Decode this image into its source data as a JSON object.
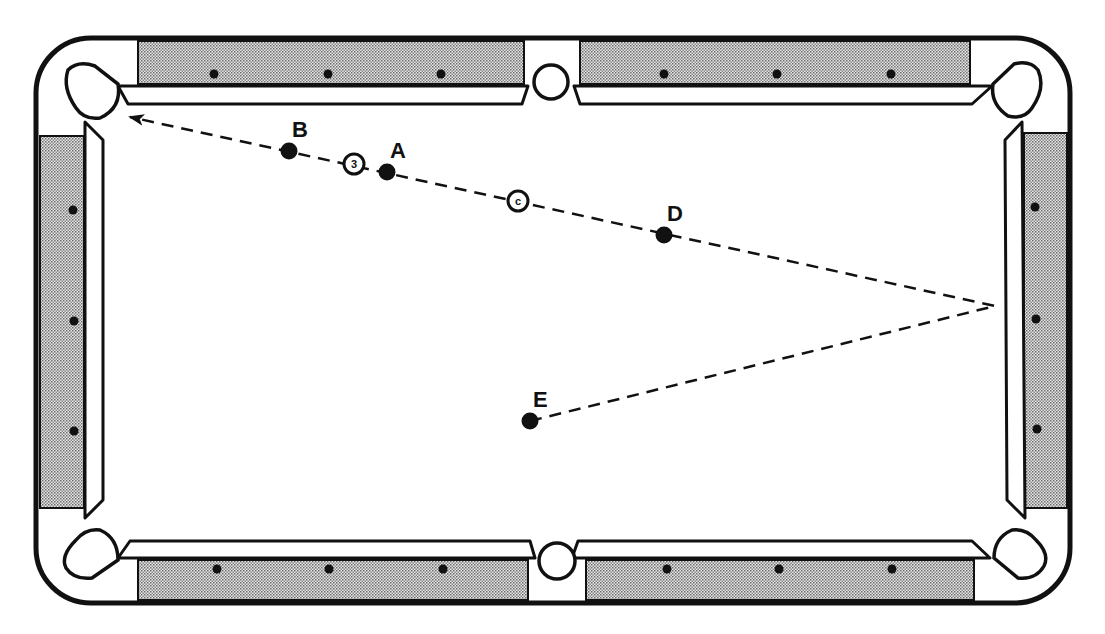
{
  "diagram": {
    "type": "pool-table-shot-diagram",
    "colors": {
      "line": "#111111",
      "rail_fill": "#bdbdbd",
      "background": "#ffffff"
    },
    "balls": [
      {
        "id": "A",
        "label": "A",
        "x": 387,
        "y": 172
      },
      {
        "id": "B",
        "label": "B",
        "x": 289,
        "y": 151
      },
      {
        "id": "D",
        "label": "D",
        "x": 664,
        "y": 235
      },
      {
        "id": "E",
        "label": "E",
        "x": 530,
        "y": 421
      }
    ],
    "marked_balls": [
      {
        "id": "ball-3",
        "label": "3",
        "x": 354,
        "y": 164
      },
      {
        "id": "cue-ball",
        "label": "c",
        "x": 518,
        "y": 201
      }
    ],
    "shot_path": {
      "style": "dashed",
      "points": [
        [
          530,
          421
        ],
        [
          995,
          306
        ],
        [
          130,
          117
        ]
      ],
      "arrow_at_end": true,
      "bank_point": [
        995,
        306
      ]
    },
    "diamonds": {
      "top": [
        [
          214,
          74
        ],
        [
          328,
          74
        ],
        [
          441,
          74
        ],
        [
          664,
          74
        ],
        [
          777,
          74
        ],
        [
          891,
          74
        ]
      ],
      "bottom": [
        [
          217,
          569
        ],
        [
          329,
          569
        ],
        [
          443,
          569
        ],
        [
          667,
          569
        ],
        [
          779,
          569
        ],
        [
          892,
          569
        ]
      ],
      "left": [
        [
          73,
          210
        ],
        [
          74,
          321
        ],
        [
          74,
          431
        ]
      ],
      "right": [
        [
          1035,
          207
        ],
        [
          1036,
          319
        ],
        [
          1037,
          429
        ]
      ]
    }
  }
}
